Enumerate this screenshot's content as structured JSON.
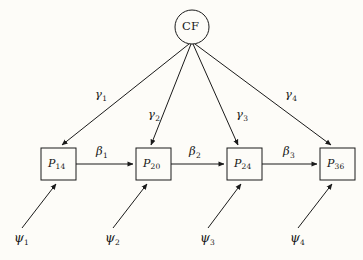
{
  "figure": {
    "type": "path-diagram",
    "background_color": "#fdfcf8",
    "line_color": "#1a1a1a"
  },
  "latent": {
    "id": "CF",
    "label": "CF",
    "shape": "circle",
    "cx": 192,
    "cy": 27,
    "r": 17
  },
  "boxes": [
    {
      "id": "P14",
      "symbol": "P",
      "subscript": "14",
      "x": 41,
      "y": 148,
      "w": 35,
      "h": 32
    },
    {
      "id": "P20",
      "symbol": "P",
      "subscript": "20",
      "x": 136,
      "y": 148,
      "w": 35,
      "h": 32
    },
    {
      "id": "P24",
      "symbol": "P",
      "subscript": "24",
      "x": 227,
      "y": 148,
      "w": 35,
      "h": 32
    },
    {
      "id": "P36",
      "symbol": "P",
      "subscript": "36",
      "x": 320,
      "y": 148,
      "w": 35,
      "h": 32
    }
  ],
  "gamma_paths": [
    {
      "id": "g1",
      "symbol": "γ",
      "subscript": "1",
      "from": "CF",
      "to": "P14",
      "label_x": 95,
      "label_y": 89
    },
    {
      "id": "g2",
      "symbol": "γ",
      "subscript": "2",
      "from": "CF",
      "to": "P20",
      "label_x": 148,
      "label_y": 109
    },
    {
      "id": "g3",
      "symbol": "γ",
      "subscript": "3",
      "from": "CF",
      "to": "P24",
      "label_x": 236,
      "label_y": 109
    },
    {
      "id": "g4",
      "symbol": "γ",
      "subscript": "4",
      "from": "CF",
      "to": "P36",
      "label_x": 285,
      "label_y": 89
    }
  ],
  "beta_paths": [
    {
      "id": "b1",
      "symbol": "β",
      "subscript": "1",
      "from": "P14",
      "to": "P20",
      "label_x": 96,
      "label_y": 146
    },
    {
      "id": "b2",
      "symbol": "β",
      "subscript": "2",
      "from": "P20",
      "to": "P24",
      "label_x": 189,
      "label_y": 146
    },
    {
      "id": "b3",
      "symbol": "β",
      "subscript": "3",
      "from": "P24",
      "to": "P36",
      "label_x": 283,
      "label_y": 146
    }
  ],
  "disturbances": [
    {
      "id": "psi1",
      "symbol": "ψ",
      "subscript": "1",
      "to": "P14",
      "label_x": 14,
      "label_y": 232
    },
    {
      "id": "psi2",
      "symbol": "ψ",
      "subscript": "2",
      "to": "P20",
      "label_x": 105,
      "label_y": 232
    },
    {
      "id": "psi3",
      "symbol": "ψ",
      "subscript": "3",
      "to": "P24",
      "label_x": 200,
      "label_y": 232
    },
    {
      "id": "psi4",
      "symbol": "ψ",
      "subscript": "4",
      "to": "P36",
      "label_x": 290,
      "label_y": 232
    }
  ]
}
